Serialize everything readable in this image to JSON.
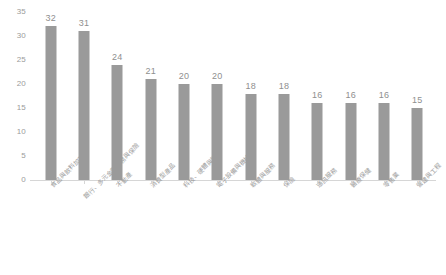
{
  "chart_data": {
    "type": "bar",
    "title": "",
    "subtitle": "",
    "xlabel": "",
    "ylabel": "",
    "ylim": [
      0,
      35
    ],
    "grid": false,
    "legend": "none",
    "bar_color": "#9a9a9a",
    "axis_color": "#d6d6d6",
    "tick_label_color": "#9b9b9b",
    "value_label_color": "#8f8f8f",
    "yticks": [
      "0",
      "5",
      "10",
      "15",
      "20",
      "25",
      "30",
      "35"
    ],
    "ytick_values": [
      0,
      5,
      10,
      15,
      20,
      25,
      30,
      35
    ],
    "categories": [
      "食品與飲料加工",
      "銀行、多元金融服務與保險",
      "不動產",
      "消費型產品",
      "科技、硬體與設備",
      "電子設備與機械",
      "軟體與服務",
      "保險",
      "通訊服務",
      "醫療保健",
      "零售業",
      "營建與工程"
    ],
    "values": [
      32,
      31,
      24,
      21,
      20,
      20,
      18,
      18,
      16,
      16,
      16,
      15
    ],
    "value_labels": [
      "32",
      "31",
      "24",
      "21",
      "20",
      "20",
      "18",
      "18",
      "16",
      "16",
      "16",
      "15"
    ]
  }
}
